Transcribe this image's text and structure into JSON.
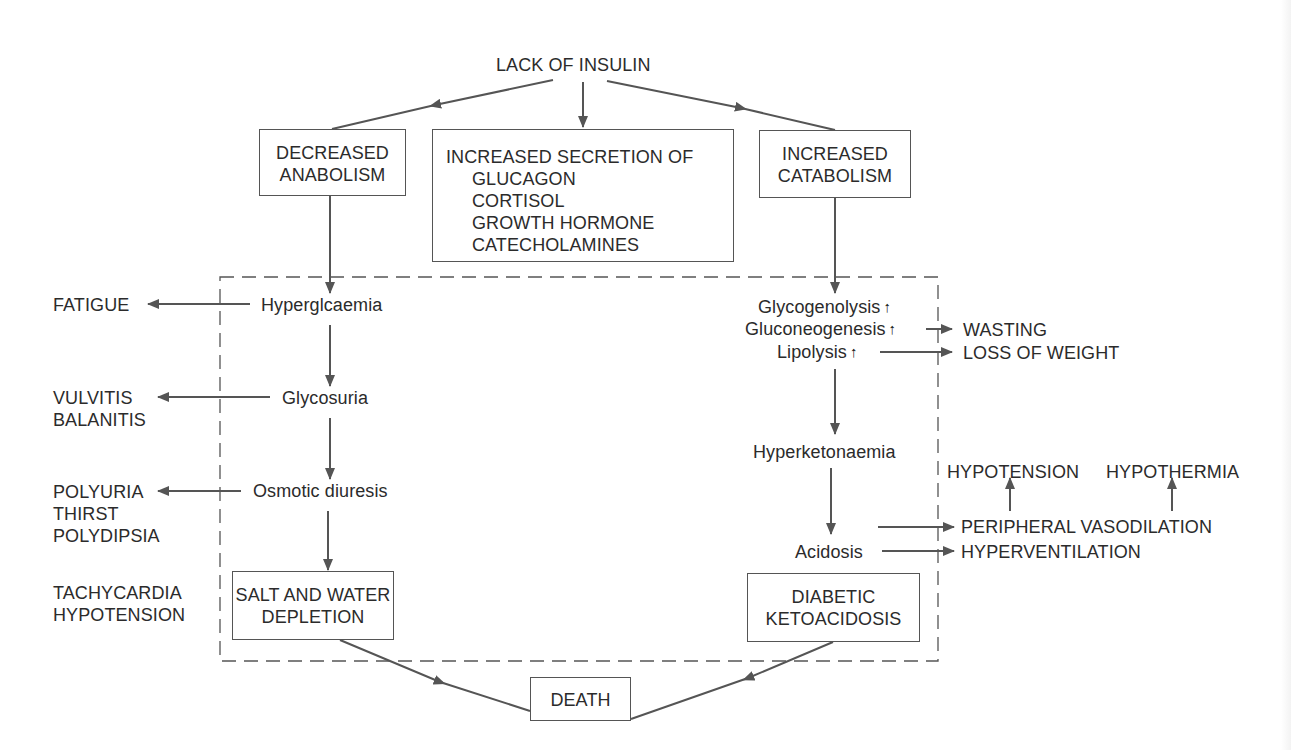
{
  "diagram": {
    "root": "LACK OF INSULIN",
    "top_boxes": {
      "left": [
        "DECREASED",
        "ANABOLISM"
      ],
      "center": {
        "heading": "INCREASED SECRETION OF",
        "items": [
          "GLUCAGON",
          "CORTISOL",
          "GROWTH HORMONE",
          "CATECHOLAMINES"
        ]
      },
      "right": [
        "INCREASED",
        "CATABOLISM"
      ]
    },
    "left_chain": [
      {
        "label": "Hyperglcaemia",
        "effect": [
          "FATIGUE"
        ]
      },
      {
        "label": "Glycosuria",
        "effect": [
          "VULVITIS",
          "BALANITIS"
        ]
      },
      {
        "label": "Osmotic diuresis",
        "effect": [
          "POLYURIA",
          "THIRST",
          "POLYDIPSIA"
        ]
      }
    ],
    "left_box": [
      "SALT AND WATER",
      "DEPLETION"
    ],
    "left_box_effect": [
      "TACHYCARDIA",
      "HYPOTENSION"
    ],
    "right_chain": {
      "processes": [
        "Glycogenolysis",
        "Gluconeogenesis",
        "Lipolysis"
      ],
      "process_effects": [
        "WASTING",
        "LOSS OF WEIGHT"
      ],
      "hyperketonaemia": "Hyperketonaemia",
      "acidosis": "Acidosis",
      "acidosis_effects": {
        "vasodilation": "PERIPHERAL VASODILATION",
        "hyperventilation": "HYPERVENTILATION",
        "hypotension": "HYPOTENSION",
        "hypothermia": "HYPOTHERMIA"
      }
    },
    "right_box": [
      "DIABETIC",
      "KETOACIDOSIS"
    ],
    "final": "DEATH",
    "up_arrow_glyph": "🠕",
    "line_color": "#555555",
    "text_color": "#2b2b2b"
  }
}
